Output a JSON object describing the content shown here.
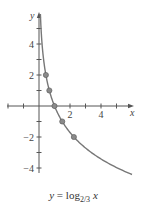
{
  "chart_data": {
    "type": "line",
    "caption": {
      "y": "y",
      "eq": "=",
      "fn": "log",
      "base": "2/3",
      "x": "x"
    },
    "xlabel": "x",
    "ylabel": "y",
    "xlim": [
      -2,
      6
    ],
    "ylim": [
      -4.5,
      6
    ],
    "xticks": [
      -2,
      -1,
      1,
      2,
      3,
      4,
      5
    ],
    "xtick_labels": [
      {
        "value": 2,
        "label": "2"
      },
      {
        "value": 4,
        "label": "4"
      }
    ],
    "yticks": [
      -4,
      -3,
      -2,
      -1,
      1,
      2,
      3,
      4,
      5
    ],
    "ytick_labels": [
      {
        "value": 4,
        "label": "4"
      },
      {
        "value": 2,
        "label": "2"
      },
      {
        "value": -2,
        "label": "−2"
      },
      {
        "value": -4,
        "label": "−4"
      }
    ],
    "grid": false,
    "function": "log_{2/3}(x)",
    "base": 0.6666667,
    "curve_x_range": [
      0.09,
      6.0
    ],
    "series": [
      {
        "name": "y = log_{2/3} x",
        "highlighted_points": [
          {
            "x": 0.444,
            "y": 2
          },
          {
            "x": 0.667,
            "y": 1
          },
          {
            "x": 1,
            "y": 0
          },
          {
            "x": 1.5,
            "y": -1
          },
          {
            "x": 2.25,
            "y": -2
          }
        ]
      }
    ],
    "colors": {
      "axis": "#555555",
      "curve": "#777777",
      "points": "#8a8a8a"
    }
  }
}
